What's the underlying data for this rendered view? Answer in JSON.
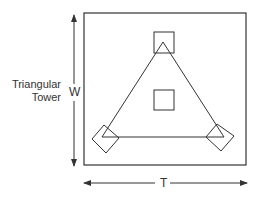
{
  "diagram": {
    "title_line1": "Triangular",
    "title_line2": "Tower",
    "width_label": "W",
    "depth_label": "T",
    "stroke_color": "#333333",
    "background": "#ffffff",
    "elements": {
      "outer_boundary": {
        "shape": "square",
        "x": 84,
        "y": 13,
        "w": 162,
        "h": 152
      },
      "triangle": {
        "apex": [
          163,
          42
        ],
        "base_left": [
          102,
          137
        ],
        "base_right": [
          224,
          137
        ]
      },
      "top_leg_block": {
        "shape": "square",
        "x": 154,
        "y": 32,
        "w": 20,
        "h": 21
      },
      "center_block": {
        "shape": "square",
        "x": 154,
        "y": 90,
        "w": 20,
        "h": 20
      },
      "left_leg_block": {
        "shape": "diamond",
        "center": [
          106,
          139
        ]
      },
      "right_leg_block": {
        "shape": "diamond",
        "center": [
          220,
          137
        ]
      },
      "width_arrow": {
        "orientation": "vertical",
        "x": 74,
        "y1": 15,
        "y2": 166
      },
      "depth_arrow": {
        "orientation": "horizontal",
        "y": 183,
        "x1": 84,
        "x2": 247
      }
    }
  }
}
